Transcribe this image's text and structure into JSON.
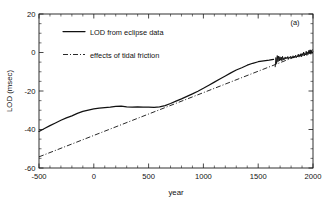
{
  "chart_data": {
    "type": "line",
    "title": "",
    "panel_label": "(a)",
    "xlabel": "year",
    "ylabel": "LOD (msec)",
    "xlim": [
      -500,
      2000
    ],
    "ylim": [
      -60,
      20
    ],
    "xticks": [
      -500,
      0,
      500,
      1000,
      1500,
      2000
    ],
    "xticklabels": [
      "-500",
      "0",
      "500",
      "1000",
      "1500",
      "2000"
    ],
    "yticks": [
      -60,
      -40,
      -20,
      0,
      20
    ],
    "yticklabels": [
      "-60",
      "-40",
      "-20",
      "0",
      "20"
    ],
    "x_minor_tick_interval": 100,
    "y_minor_tick_interval": 5,
    "grid": false,
    "legend_position": "upper-left-inside",
    "series": [
      {
        "name": "LOD from eclipse data",
        "style": "solid",
        "x": [
          -500,
          -450,
          -400,
          -350,
          -300,
          -250,
          -200,
          -150,
          -100,
          -50,
          0,
          50,
          100,
          150,
          200,
          250,
          300,
          350,
          400,
          450,
          500,
          550,
          600,
          650,
          700,
          750,
          800,
          850,
          900,
          950,
          1000,
          1050,
          1100,
          1150,
          1200,
          1250,
          1300,
          1350,
          1400,
          1450,
          1500,
          1550,
          1600,
          1640
        ],
        "y": [
          -41.0,
          -39.5,
          -38.0,
          -36.6,
          -35.2,
          -34.0,
          -32.9,
          -31.6,
          -30.6,
          -29.9,
          -29.3,
          -28.9,
          -28.6,
          -28.4,
          -28.0,
          -27.9,
          -28.2,
          -28.4,
          -28.3,
          -28.4,
          -28.4,
          -28.5,
          -28.3,
          -27.6,
          -26.5,
          -25.3,
          -24.1,
          -22.8,
          -21.5,
          -20.1,
          -18.6,
          -17.0,
          -15.4,
          -13.8,
          -12.2,
          -10.6,
          -9.1,
          -7.9,
          -6.6,
          -5.6,
          -4.8,
          -4.3,
          -4.0,
          -3.6
        ]
      },
      {
        "name": "LOD from eclipse data (modern record)",
        "style": "solid-noisy",
        "x": [
          1655,
          1662,
          1668,
          1674,
          1680,
          1686,
          1692,
          1698,
          1704,
          1710,
          1716,
          1722,
          1728,
          1734,
          1740,
          1746,
          1752,
          1758,
          1764,
          1770,
          1776,
          1782,
          1788,
          1794,
          1800,
          1806,
          1812,
          1818,
          1824,
          1830,
          1836,
          1842,
          1848,
          1854,
          1860,
          1866,
          1872,
          1878,
          1884,
          1890,
          1896,
          1902,
          1908,
          1914,
          1920,
          1926,
          1932,
          1938,
          1944,
          1950,
          1956,
          1962,
          1968,
          1974,
          1980,
          1986,
          1992,
          1998
        ],
        "y": [
          -7.4,
          -2.6,
          -5.8,
          -1.6,
          -4.8,
          -1.9,
          -4.4,
          -2.2,
          -4.0,
          -2.4,
          -4.3,
          -2.0,
          -3.9,
          -2.8,
          -3.6,
          -2.3,
          -3.4,
          -2.6,
          -3.2,
          -2.1,
          -3.3,
          -2.4,
          -3.0,
          -2.0,
          -3.1,
          -2.2,
          -2.8,
          -1.7,
          -2.9,
          -1.9,
          -2.6,
          -1.4,
          -2.7,
          -1.8,
          -2.3,
          -0.9,
          -2.4,
          -1.2,
          -2.0,
          -0.6,
          -2.2,
          -0.8,
          -1.6,
          0.2,
          -1.8,
          -0.4,
          -1.3,
          0.6,
          -1.5,
          0.1,
          -1.0,
          1.1,
          -0.6,
          1.4,
          -0.9,
          0.8,
          -0.5,
          0.4
        ]
      },
      {
        "name": "effects of tidal friction",
        "style": "dash-dot",
        "x": [
          -500,
          2000
        ],
        "y": [
          -54.2,
          1.4
        ]
      }
    ],
    "legend_entries": [
      {
        "label": "LOD from eclipse data",
        "style": "solid"
      },
      {
        "label": "effects of tidal friction",
        "style": "dash-dot"
      }
    ]
  }
}
